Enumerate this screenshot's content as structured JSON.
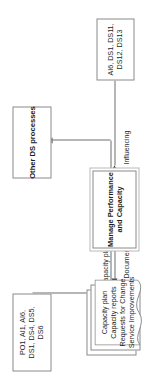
{
  "diagram": {
    "orientation": "rotated-90-ccw",
    "colors": {
      "node_fill": "#ffffff",
      "node_border": "#8a8a8a",
      "connector": "#6f6f6f",
      "arrowhead": "#3f3f3f",
      "text": "#1d1d1d"
    },
    "nodes": {
      "governance": {
        "name": "governance-references",
        "lines": [
          "PO1, AI1, AI6,",
          "DS1, DS4, DS5,",
          "DS6"
        ]
      },
      "other_ds": {
        "name": "other-ds-processes",
        "lines": [
          "Other DS processes"
        ]
      },
      "process": {
        "name": "manage-performance-and-capacity",
        "lines": [
          "Manage Performance",
          "and Capacity"
        ]
      },
      "inputs": {
        "name": "input-references",
        "lines": [
          "AI6, DS1, DS11,",
          "DS12, DS13"
        ]
      },
      "documents": {
        "name": "output-documents",
        "lines": [
          "Capacity plan",
          "Capacity reports",
          "Requests for Change",
          "Service Improvements"
        ]
      }
    },
    "edges": {
      "capacity_plan": "Capacity plan",
      "influencing": "Influencing",
      "documents": "Documents"
    }
  }
}
